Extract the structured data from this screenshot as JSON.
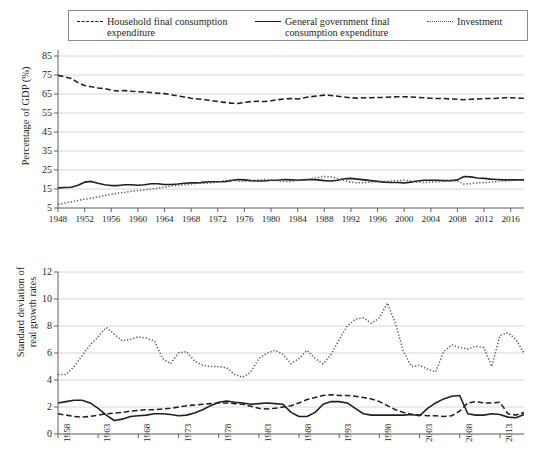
{
  "legend": {
    "items": [
      {
        "id": "household",
        "label": "Household final consumption\nexpenditure",
        "style": "dashed",
        "color": "#231f20"
      },
      {
        "id": "government",
        "label": "General government final\nconsumption expenditure",
        "style": "solid",
        "color": "#231f20"
      },
      {
        "id": "investment",
        "label": "Investment",
        "style": "dotted",
        "color": "#5a5a5a"
      }
    ]
  },
  "chart_data": [
    {
      "id": "top",
      "type": "line",
      "title": "",
      "xlabel": "",
      "ylabel": "Percentage of GDP (%)",
      "xlim": [
        1948,
        2018
      ],
      "ylim": [
        5,
        85
      ],
      "yticks": [
        5,
        15,
        25,
        35,
        45,
        55,
        65,
        75,
        85
      ],
      "xticks": [
        1948,
        1952,
        1956,
        1960,
        1964,
        1968,
        1972,
        1976,
        1980,
        1984,
        1988,
        1992,
        1996,
        2000,
        2004,
        2008,
        2012,
        2016
      ],
      "grid": "horizontal",
      "legend_position": "above-figure",
      "x": [
        1948,
        1949,
        1950,
        1951,
        1952,
        1953,
        1954,
        1955,
        1956,
        1957,
        1958,
        1959,
        1960,
        1961,
        1962,
        1963,
        1964,
        1965,
        1966,
        1967,
        1968,
        1969,
        1970,
        1971,
        1972,
        1973,
        1974,
        1975,
        1976,
        1977,
        1978,
        1979,
        1980,
        1981,
        1982,
        1983,
        1984,
        1985,
        1986,
        1987,
        1988,
        1989,
        1990,
        1991,
        1992,
        1993,
        1994,
        1995,
        1996,
        1997,
        1998,
        1999,
        2000,
        2001,
        2002,
        2003,
        2004,
        2005,
        2006,
        2007,
        2008,
        2009,
        2010,
        2011,
        2012,
        2013,
        2014,
        2015,
        2016,
        2017,
        2018
      ],
      "series": [
        {
          "name": "Household final consumption expenditure",
          "style": "dashed",
          "color": "#231f20",
          "values": [
            74.8,
            74.0,
            73.2,
            71.0,
            69.5,
            68.8,
            68.2,
            67.8,
            67.0,
            66.6,
            66.8,
            66.4,
            66.2,
            66.0,
            65.8,
            65.4,
            65.2,
            64.6,
            64.0,
            63.4,
            62.8,
            62.4,
            62.0,
            61.6,
            61.0,
            60.6,
            60.2,
            60.0,
            60.6,
            61.0,
            61.2,
            61.0,
            61.4,
            62.0,
            62.4,
            62.6,
            62.4,
            63.0,
            63.6,
            64.0,
            64.4,
            64.2,
            63.8,
            63.4,
            63.0,
            62.8,
            63.0,
            63.0,
            63.2,
            63.2,
            63.4,
            63.6,
            63.6,
            63.4,
            63.2,
            63.0,
            62.8,
            62.6,
            62.6,
            62.4,
            62.2,
            62.0,
            62.2,
            62.4,
            62.6,
            62.6,
            62.8,
            63.0,
            63.0,
            62.8,
            62.8
          ]
        },
        {
          "name": "General government final consumption expenditure",
          "style": "solid",
          "color": "#231f20",
          "values": [
            15.6,
            15.8,
            15.9,
            17.0,
            18.6,
            19.0,
            18.0,
            17.2,
            16.8,
            16.8,
            17.2,
            17.2,
            17.0,
            17.2,
            17.8,
            17.8,
            17.4,
            17.4,
            17.6,
            18.0,
            18.2,
            18.2,
            18.6,
            18.8,
            18.8,
            18.8,
            19.4,
            20.0,
            19.8,
            19.4,
            19.2,
            19.2,
            19.6,
            19.6,
            20.0,
            19.8,
            19.6,
            19.8,
            20.0,
            19.8,
            19.4,
            19.2,
            19.6,
            20.4,
            20.6,
            20.2,
            19.8,
            19.4,
            19.0,
            18.6,
            18.4,
            18.4,
            18.2,
            18.6,
            19.2,
            19.6,
            19.6,
            19.6,
            19.4,
            19.4,
            19.8,
            21.6,
            21.4,
            20.8,
            20.6,
            20.2,
            20.0,
            19.8,
            19.8,
            19.8,
            19.8
          ]
        },
        {
          "name": "Investment",
          "style": "dotted",
          "color": "#5a5a5a",
          "values": [
            7.0,
            7.6,
            8.2,
            9.0,
            9.6,
            10.2,
            10.8,
            11.6,
            12.2,
            12.8,
            13.2,
            13.8,
            14.2,
            14.6,
            15.0,
            15.4,
            16.0,
            16.6,
            17.0,
            17.2,
            17.6,
            18.0,
            18.0,
            18.2,
            18.6,
            19.4,
            19.8,
            19.2,
            19.0,
            19.4,
            19.8,
            20.0,
            19.6,
            19.4,
            19.0,
            19.0,
            19.6,
            20.0,
            20.4,
            21.0,
            21.6,
            21.4,
            20.6,
            19.4,
            18.6,
            18.2,
            18.4,
            18.6,
            18.8,
            19.0,
            19.2,
            19.4,
            19.6,
            19.2,
            18.6,
            18.4,
            18.6,
            18.8,
            19.2,
            19.4,
            19.2,
            17.6,
            17.8,
            18.2,
            18.4,
            18.6,
            19.0,
            19.2,
            19.4,
            19.6,
            19.6
          ]
        }
      ]
    },
    {
      "id": "bottom",
      "type": "line",
      "title": "",
      "xlabel": "",
      "ylabel": "Standard deviation of\nreal growth rates",
      "xlim": [
        1958,
        2016
      ],
      "ylim": [
        0,
        12
      ],
      "yticks": [
        0,
        2,
        4,
        6,
        8,
        10,
        12
      ],
      "xticks": [
        1958,
        1963,
        1968,
        1973,
        1978,
        1983,
        1988,
        1993,
        1998,
        2003,
        2008,
        2013
      ],
      "grid": "horizontal",
      "legend_position": "above-figure",
      "x": [
        1958,
        1959,
        1960,
        1961,
        1962,
        1963,
        1964,
        1965,
        1966,
        1967,
        1968,
        1969,
        1970,
        1971,
        1972,
        1973,
        1974,
        1975,
        1976,
        1977,
        1978,
        1979,
        1980,
        1981,
        1982,
        1983,
        1984,
        1985,
        1986,
        1987,
        1988,
        1989,
        1990,
        1991,
        1992,
        1993,
        1994,
        1995,
        1996,
        1997,
        1998,
        1999,
        2000,
        2001,
        2002,
        2003,
        2004,
        2005,
        2006,
        2007,
        2008,
        2009,
        2010,
        2011,
        2012,
        2013,
        2014,
        2015,
        2016
      ],
      "series": [
        {
          "name": "Household final consumption expenditure",
          "style": "dashed",
          "color": "#231f20",
          "values": [
            1.5,
            1.4,
            1.3,
            1.25,
            1.3,
            1.4,
            1.5,
            1.55,
            1.6,
            1.7,
            1.75,
            1.8,
            1.8,
            1.85,
            1.9,
            2.0,
            2.1,
            2.15,
            2.2,
            2.25,
            2.3,
            2.3,
            2.25,
            2.2,
            2.05,
            1.9,
            1.85,
            1.9,
            2.0,
            2.1,
            2.3,
            2.55,
            2.7,
            2.85,
            2.9,
            2.85,
            2.85,
            2.8,
            2.7,
            2.6,
            2.4,
            2.1,
            1.8,
            1.6,
            1.45,
            1.4,
            1.35,
            1.35,
            1.3,
            1.35,
            1.7,
            2.3,
            2.4,
            2.3,
            2.3,
            2.35,
            1.5,
            1.4,
            1.6
          ]
        },
        {
          "name": "General government final consumption expenditure",
          "style": "solid",
          "color": "#231f20",
          "values": [
            2.3,
            2.4,
            2.5,
            2.5,
            2.3,
            1.9,
            1.4,
            1.0,
            1.1,
            1.3,
            1.35,
            1.4,
            1.5,
            1.5,
            1.45,
            1.35,
            1.4,
            1.55,
            1.8,
            2.1,
            2.35,
            2.45,
            2.35,
            2.3,
            2.2,
            2.25,
            2.3,
            2.25,
            2.2,
            1.6,
            1.3,
            1.3,
            1.6,
            2.2,
            2.4,
            2.4,
            2.3,
            1.9,
            1.5,
            1.4,
            1.4,
            1.4,
            1.4,
            1.4,
            1.45,
            1.35,
            1.9,
            2.3,
            2.6,
            2.8,
            2.85,
            1.5,
            1.4,
            1.4,
            1.5,
            1.45,
            1.25,
            1.2,
            1.45
          ]
        },
        {
          "name": "Investment",
          "style": "dotted",
          "color": "#5a5a5a",
          "values": [
            4.4,
            4.4,
            5.0,
            5.8,
            6.6,
            7.2,
            7.9,
            7.4,
            6.9,
            7.0,
            7.2,
            7.1,
            6.9,
            5.6,
            5.2,
            6.0,
            6.1,
            5.4,
            5.1,
            5.0,
            5.0,
            4.9,
            4.4,
            4.2,
            4.6,
            5.6,
            6.0,
            6.2,
            5.9,
            5.2,
            5.6,
            6.2,
            5.6,
            5.2,
            5.9,
            7.0,
            8.0,
            8.5,
            8.6,
            8.2,
            8.6,
            9.7,
            8.2,
            6.1,
            5.0,
            5.1,
            4.8,
            4.6,
            6.1,
            6.6,
            6.4,
            6.3,
            6.5,
            6.4,
            5.0,
            7.3,
            7.5,
            7.0,
            6.0
          ]
        }
      ]
    }
  ]
}
